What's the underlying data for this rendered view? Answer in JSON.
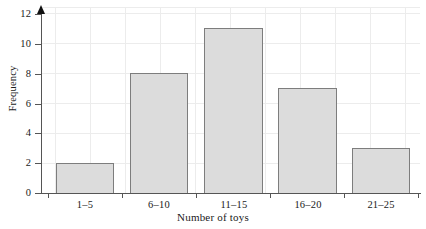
{
  "chart_data": {
    "type": "bar",
    "title": "",
    "xlabel": "Number of toys",
    "ylabel": "Frequency",
    "categories": [
      "1–5",
      "6–10",
      "11–15",
      "16–20",
      "21–25"
    ],
    "values": [
      2,
      8,
      11,
      7,
      3
    ],
    "ylim": [
      0,
      12
    ],
    "ytick_labels": [
      "0",
      "2",
      "4",
      "6",
      "8",
      "10",
      "12"
    ],
    "ytick_values": [
      0,
      2,
      4,
      6,
      8,
      10,
      12
    ],
    "grid": true,
    "legend": null,
    "legend_position": "none",
    "bar_fill_color": "#dcdcdc",
    "bar_border_color": "#7d7d7d",
    "axis_color": "#555555",
    "gridline_color": "#ececec",
    "background_color": "#ffffff",
    "y_axis_has_arrow": true
  },
  "axis": {
    "y_title": "Frequency",
    "x_title": "Number of toys"
  },
  "top_clipped_text": ""
}
